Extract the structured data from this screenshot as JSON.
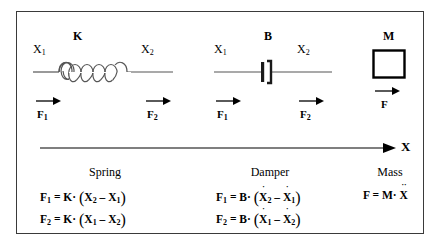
{
  "figure": {
    "border_color": "#3a3a3a",
    "line_color": "#555555",
    "text_color": "#000000"
  },
  "axis": {
    "label": "X",
    "direction": "right"
  },
  "elements": [
    {
      "id": "spring",
      "symbol": "K",
      "caption": "Spring",
      "node_left": "X",
      "node_left_sub": "1",
      "node_right": "X",
      "node_right_sub": "2",
      "force_left": "F",
      "force_left_sub": "1",
      "force_right": "F",
      "force_right_sub": "2",
      "equations": [
        {
          "lhs": "F",
          "lhs_sub": "1",
          "eq": "=",
          "coeff": "K",
          "dot": "·",
          "open": "(",
          "term1": "X",
          "term1_sub": "2",
          "term1_dots": "",
          "op": "–",
          "term2": "X",
          "term2_sub": "1",
          "term2_dots": "",
          "close": ")"
        },
        {
          "lhs": "F",
          "lhs_sub": "2",
          "eq": "=",
          "coeff": "K",
          "dot": "·",
          "open": "(",
          "term1": "X",
          "term1_sub": "1",
          "term1_dots": "",
          "op": "–",
          "term2": "X",
          "term2_sub": "2",
          "term2_dots": "",
          "close": ")"
        }
      ]
    },
    {
      "id": "damper",
      "symbol": "B",
      "caption": "Damper",
      "node_left": "X",
      "node_left_sub": "1",
      "node_right": "X",
      "node_right_sub": "2",
      "force_left": "F",
      "force_left_sub": "1",
      "force_right": "F",
      "force_right_sub": "2",
      "equations": [
        {
          "lhs": "F",
          "lhs_sub": "1",
          "eq": "=",
          "coeff": "B",
          "dot": "·",
          "open": "(",
          "term1": "X",
          "term1_sub": "2",
          "term1_dots": "˙",
          "op": "–",
          "term2": "X",
          "term2_sub": "1",
          "term2_dots": "˙",
          "close": ")"
        },
        {
          "lhs": "F",
          "lhs_sub": "2",
          "eq": "=",
          "coeff": "B",
          "dot": "·",
          "open": "(",
          "term1": "X",
          "term1_sub": "1",
          "term1_dots": "˙",
          "op": "–",
          "term2": "X",
          "term2_sub": "2",
          "term2_dots": "˙",
          "close": ")"
        }
      ]
    },
    {
      "id": "mass",
      "symbol": "M",
      "caption": "Mass",
      "force_right": "F",
      "force_right_sub": "",
      "equations": [
        {
          "lhs": "F",
          "lhs_sub": "",
          "eq": "=",
          "coeff": "M",
          "dot": "·",
          "open": "",
          "term1": "X",
          "term1_sub": "",
          "term1_dots": "˙˙",
          "op": "",
          "term2": "",
          "term2_sub": "",
          "term2_dots": "",
          "close": ""
        }
      ]
    }
  ]
}
